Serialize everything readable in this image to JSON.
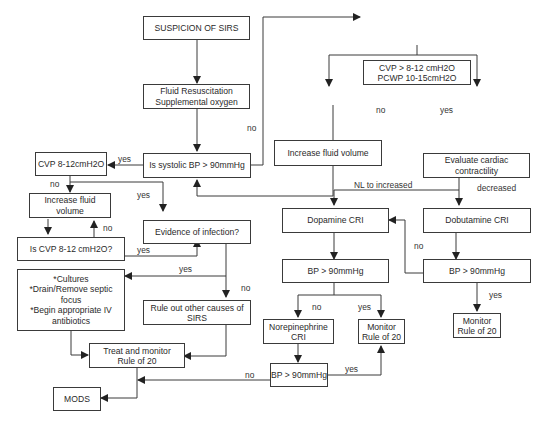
{
  "diagram": {
    "nodes": [
      {
        "id": "suspicion",
        "text": "SUSPICION OF SIRS"
      },
      {
        "id": "fluid_resus",
        "text": "Fluid Resuscitation\nSupplemental oxygen"
      },
      {
        "id": "systolic_bp",
        "text": "Is systolic BP > 90mmHg"
      },
      {
        "id": "cvp_pcwp",
        "text": "CVP > 8-12 cmH2O\nPCWP  10-15cmH2O"
      },
      {
        "id": "increase_fluid_right",
        "text": "Increase fluid volume"
      },
      {
        "id": "eval_cardiac",
        "text": "Evaluate cardiac\ncontractility"
      },
      {
        "id": "cvp_left",
        "text": "CVP  8-12cmH2O"
      },
      {
        "id": "increase_fluid_left",
        "text": "Increase fluid volume"
      },
      {
        "id": "is_cvp",
        "text": "Is CVP  8-12 cmH2O?"
      },
      {
        "id": "evidence_infection",
        "text": "Evidence of infection?"
      },
      {
        "id": "cultures",
        "text": "*Cultures\n*Drain/Remove septic\nfocus\n*Begin appropriate IV\nantibiotics"
      },
      {
        "id": "rule_out",
        "text": "Rule out other causes of\nSIRS"
      },
      {
        "id": "treat_monitor",
        "text": "Treat and monitor\nRule of 20"
      },
      {
        "id": "mods",
        "text": "MODS"
      },
      {
        "id": "dopamine",
        "text": "Dopamine CRI"
      },
      {
        "id": "dobutamine",
        "text": "Dobutamine CRI"
      },
      {
        "id": "bp_dopamine",
        "text": "BP > 90mmHg"
      },
      {
        "id": "bp_dobutamine",
        "text": "BP > 90mmHg"
      },
      {
        "id": "norepinephrine",
        "text": "Norepinephrine\nCRI"
      },
      {
        "id": "monitor_mid",
        "text": "Monitor\nRule of 20"
      },
      {
        "id": "monitor_right",
        "text": "Monitor\nRule of 20"
      },
      {
        "id": "bp_norepi",
        "text": "BP > 90mmHg"
      }
    ],
    "edge_labels": {
      "sys_no": "no",
      "sys_yes": "yes",
      "cvp_pcwp_no": "no",
      "cvp_pcwp_yes": "yes",
      "cvp_left_no": "no",
      "cvp_left_yes": "yes",
      "is_cvp_no": "no",
      "is_cvp_yes": "yes",
      "infection_yes": "yes",
      "infection_no": "no",
      "nl_increased": "NL to increased",
      "decreased": "decreased",
      "dobut_bp_no": "no",
      "dobut_bp_yes": "yes",
      "dopa_bp_no": "no",
      "dopa_bp_yes": "yes",
      "norepi_bp_yes": "yes",
      "norepi_bp_no": "no"
    }
  }
}
